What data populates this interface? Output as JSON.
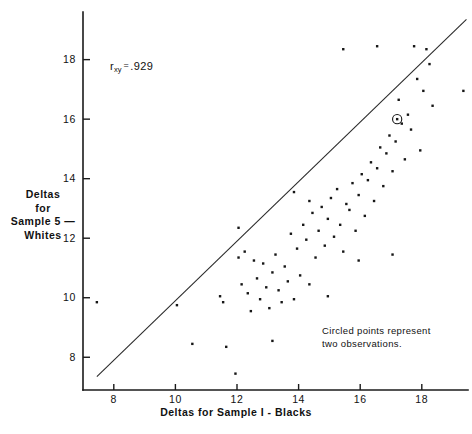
{
  "figure": {
    "width": 472,
    "height": 434,
    "background": "#ffffff",
    "ink_color": "#161616"
  },
  "annotations": {
    "correlation_symbol": "r",
    "correlation_subscript": "xy",
    "correlation_equals": "=",
    "correlation_value": ".929",
    "note_line1": "Circled points represent",
    "note_line2": "two observations."
  },
  "axis_titles": {
    "x": "Deltas  for  Sample I - Blacks",
    "y_line1": "Deltas",
    "y_line2": "for",
    "y_line3": "Sample 5 —",
    "y_line4": "Whites"
  },
  "chart_data": {
    "type": "scatter",
    "title": "",
    "subtitle": "",
    "xlabel": "Deltas  for  Sample I - Blacks",
    "ylabel": "Deltas for Sample 5 — Whites",
    "xlim": [
      7.0,
      19.5
    ],
    "ylim": [
      6.9,
      19.6
    ],
    "xticks": [
      8,
      10,
      12,
      14,
      16,
      18
    ],
    "yticks": [
      8,
      10,
      12,
      14,
      16,
      18
    ],
    "xtick_labels": [
      "8",
      "10",
      "12",
      "14",
      "16",
      "18"
    ],
    "ytick_labels": [
      "8",
      "10",
      "12",
      "14",
      "16",
      "18"
    ],
    "grid": false,
    "legend": false,
    "correlation": 0.929,
    "reference_line": {
      "label": "identity line y = x",
      "x_start": 7.45,
      "y_start": 7.35,
      "x_end": 19.45,
      "y_end": 19.35,
      "style": "solid"
    },
    "series": [
      {
        "name": "Deltas (Sample 1 Blacks vs Sample 5 Whites)",
        "marker": "dot",
        "points": [
          [
            7.45,
            9.85
          ],
          [
            10.05,
            9.75
          ],
          [
            10.55,
            8.45
          ],
          [
            11.45,
            10.05
          ],
          [
            11.55,
            9.85
          ],
          [
            11.65,
            8.35
          ],
          [
            11.95,
            7.45
          ],
          [
            12.05,
            11.35
          ],
          [
            12.15,
            10.45
          ],
          [
            12.25,
            11.55
          ],
          [
            12.35,
            10.15
          ],
          [
            12.45,
            9.55
          ],
          [
            12.55,
            11.25
          ],
          [
            12.65,
            10.65
          ],
          [
            12.75,
            9.95
          ],
          [
            12.85,
            11.15
          ],
          [
            12.95,
            10.35
          ],
          [
            13.05,
            9.65
          ],
          [
            13.15,
            10.85
          ],
          [
            13.25,
            11.45
          ],
          [
            13.35,
            10.25
          ],
          [
            13.45,
            9.85
          ],
          [
            13.55,
            11.05
          ],
          [
            13.65,
            10.55
          ],
          [
            13.75,
            12.15
          ],
          [
            13.85,
            9.95
          ],
          [
            13.95,
            11.65
          ],
          [
            14.05,
            10.75
          ],
          [
            14.15,
            12.45
          ],
          [
            14.25,
            11.95
          ],
          [
            14.35,
            10.45
          ],
          [
            14.45,
            12.85
          ],
          [
            14.55,
            11.35
          ],
          [
            14.65,
            12.25
          ],
          [
            14.75,
            13.05
          ],
          [
            14.85,
            11.75
          ],
          [
            14.95,
            12.65
          ],
          [
            15.05,
            13.35
          ],
          [
            15.15,
            12.05
          ],
          [
            15.25,
            13.65
          ],
          [
            15.35,
            12.45
          ],
          [
            15.45,
            11.55
          ],
          [
            15.55,
            13.15
          ],
          [
            15.65,
            12.95
          ],
          [
            15.75,
            13.85
          ],
          [
            15.85,
            12.25
          ],
          [
            15.95,
            13.45
          ],
          [
            16.05,
            14.15
          ],
          [
            16.15,
            12.75
          ],
          [
            16.25,
            13.95
          ],
          [
            16.35,
            14.55
          ],
          [
            16.45,
            13.25
          ],
          [
            16.55,
            14.35
          ],
          [
            16.65,
            15.05
          ],
          [
            16.75,
            13.75
          ],
          [
            16.85,
            14.85
          ],
          [
            16.95,
            15.45
          ],
          [
            17.05,
            14.25
          ],
          [
            17.15,
            15.25
          ],
          [
            17.25,
            16.65
          ],
          [
            17.35,
            15.85
          ],
          [
            17.45,
            14.65
          ],
          [
            17.55,
            16.15
          ],
          [
            17.65,
            15.65
          ],
          [
            17.75,
            18.45
          ],
          [
            17.85,
            17.35
          ],
          [
            17.95,
            14.95
          ],
          [
            18.05,
            16.95
          ],
          [
            18.15,
            18.35
          ],
          [
            18.25,
            17.85
          ],
          [
            18.35,
            16.45
          ],
          [
            19.35,
            16.95
          ],
          [
            16.55,
            18.45
          ],
          [
            15.45,
            18.35
          ],
          [
            14.35,
            13.25
          ],
          [
            13.15,
            8.55
          ],
          [
            12.05,
            12.35
          ],
          [
            15.95,
            11.25
          ],
          [
            17.05,
            11.45
          ],
          [
            14.95,
            10.05
          ],
          [
            13.85,
            13.55
          ]
        ]
      }
    ],
    "special_points": [
      {
        "marker": "circled-dot",
        "x": 17.2,
        "y": 16.0,
        "meaning": "two observations"
      }
    ]
  }
}
